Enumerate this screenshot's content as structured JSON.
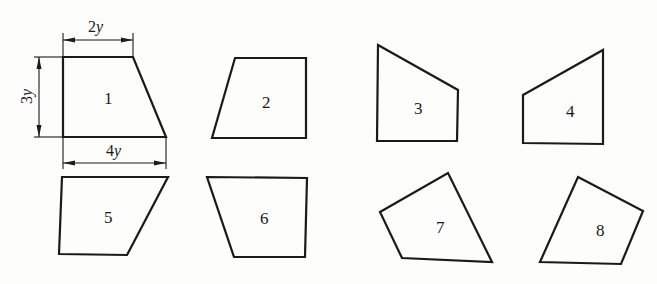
{
  "figure": {
    "dimensions": {
      "top_width": {
        "coef": "2",
        "var": "y"
      },
      "height": {
        "coef": "3",
        "var": "y"
      },
      "bottom_width": {
        "coef": "4",
        "var": "y"
      }
    },
    "shapes": [
      {
        "id": 1,
        "label": "1",
        "points": "63,57 133,57 166,137 63,137",
        "label_pos": [
          104,
          104
        ]
      },
      {
        "id": 2,
        "label": "2",
        "points": "235,58 306,58 306,138 212,138",
        "label_pos": [
          262,
          108
        ]
      },
      {
        "id": 3,
        "label": "3",
        "points": "378,45 458,90 457,141 377,141",
        "label_pos": [
          414,
          114
        ]
      },
      {
        "id": 4,
        "label": "4",
        "points": "523,95 603,50 603,144 523,143",
        "label_pos": [
          566,
          117
        ]
      },
      {
        "id": 5,
        "label": "5",
        "points": "62,177 168,177 127,255 59,254",
        "label_pos": [
          104,
          223
        ]
      },
      {
        "id": 6,
        "label": "6",
        "points": "207,177 307,178 305,257 234,257",
        "label_pos": [
          260,
          224
        ]
      },
      {
        "id": 7,
        "label": "7",
        "points": "380,212 448,173 492,262 402,258",
        "label_pos": [
          436,
          233
        ]
      },
      {
        "id": 8,
        "label": "8",
        "points": "578,177 643,211 621,264 540,262",
        "label_pos": [
          596,
          236
        ]
      }
    ]
  }
}
